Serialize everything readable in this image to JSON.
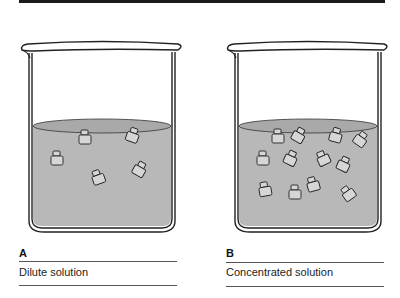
{
  "figure": {
    "colors": {
      "liquid": "#b8b8b8",
      "liquid_surface": "#a9a9a9",
      "outline": "#222222",
      "particle_fill": "#d6d6d6"
    },
    "panels": [
      {
        "letter": "A",
        "caption": "Dilute solution",
        "particle_count": 5,
        "particles": [
          {
            "x": 85,
            "y": 42,
            "r": 0
          },
          {
            "x": 133,
            "y": 40,
            "r": 20
          },
          {
            "x": 57,
            "y": 63,
            "r": 0
          },
          {
            "x": 98,
            "y": 82,
            "r": -20
          },
          {
            "x": 140,
            "y": 74,
            "r": 30
          }
        ]
      },
      {
        "letter": "B",
        "caption": "Concentrated solution",
        "particle_count": 14,
        "particles": [
          {
            "x": 278,
            "y": 40,
            "r": 0
          },
          {
            "x": 299,
            "y": 38,
            "r": 30
          },
          {
            "x": 338,
            "y": 38,
            "r": 15
          },
          {
            "x": 361,
            "y": 43,
            "r": 35
          },
          {
            "x": 263,
            "y": 63,
            "r": 0
          },
          {
            "x": 291,
            "y": 62,
            "r": 25
          },
          {
            "x": 323,
            "y": 62,
            "r": -25
          },
          {
            "x": 344,
            "y": 68,
            "r": 25
          },
          {
            "x": 265,
            "y": 93,
            "r": -10
          },
          {
            "x": 295,
            "y": 96,
            "r": 0
          },
          {
            "x": 313,
            "y": 88,
            "r": -15
          },
          {
            "x": 348,
            "y": 97,
            "r": -35
          },
          {
            "x": 359,
            "y": 26,
            "r": 20
          },
          {
            "x": 245,
            "y": 45,
            "r": 0
          }
        ]
      }
    ]
  }
}
